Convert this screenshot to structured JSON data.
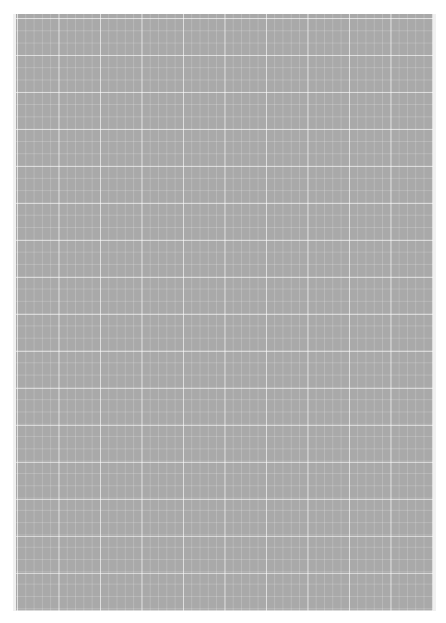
{
  "page": {
    "background_color": "#ffffff",
    "sheet_color": "#a9a9a9",
    "grid_line_color": "#ffffff"
  }
}
